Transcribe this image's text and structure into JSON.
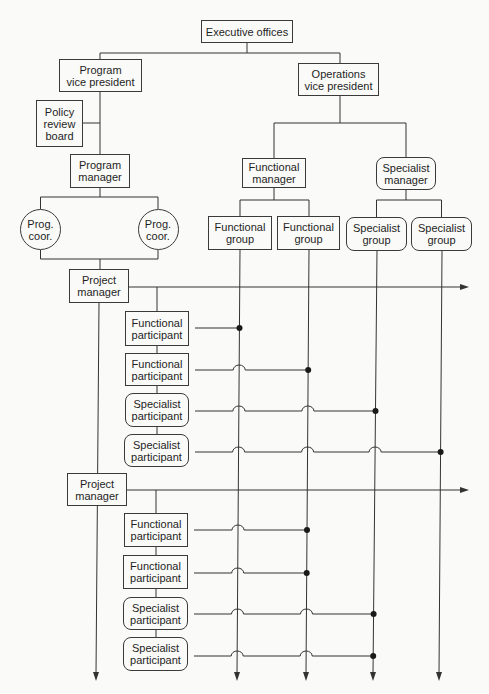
{
  "diagram": {
    "executive_offices": {
      "lines": [
        "Executive offices"
      ]
    },
    "program_vice_president": {
      "lines": [
        "Program",
        "vice president"
      ]
    },
    "operations_vice_president": {
      "lines": [
        "Operations",
        "vice president"
      ]
    },
    "policy_review_board": {
      "lines": [
        "Policy",
        "review",
        "board"
      ]
    },
    "program_manager": {
      "lines": [
        "Program",
        "manager"
      ]
    },
    "program_coordinators": [
      {
        "lines": [
          "Prog.",
          "coor."
        ]
      },
      {
        "lines": [
          "Prog.",
          "coor."
        ]
      }
    ],
    "functional_manager": {
      "lines": [
        "Functional",
        "manager"
      ]
    },
    "specialist_manager": {
      "lines": [
        "Specialist",
        "manager"
      ]
    },
    "functional_groups": [
      {
        "lines": [
          "Functional",
          "group"
        ]
      },
      {
        "lines": [
          "Functional",
          "group"
        ]
      }
    ],
    "specialist_groups": [
      {
        "lines": [
          "Specialist",
          "group"
        ]
      },
      {
        "lines": [
          "Specialist",
          "group"
        ]
      }
    ],
    "projects": [
      {
        "manager": {
          "lines": [
            "Project",
            "manager"
          ]
        },
        "participants": [
          {
            "lines": [
              "Functional",
              "participant"
            ],
            "connects_to": "functional_group_1"
          },
          {
            "lines": [
              "Functional",
              "participant"
            ],
            "connects_to": "functional_group_2"
          },
          {
            "lines": [
              "Specialist",
              "participant"
            ],
            "connects_to": "specialist_group_1"
          },
          {
            "lines": [
              "Specialist",
              "participant"
            ],
            "connects_to": "specialist_group_2"
          }
        ]
      },
      {
        "manager": {
          "lines": [
            "Project",
            "manager"
          ]
        },
        "participants": [
          {
            "lines": [
              "Functional",
              "participant"
            ],
            "connects_to": "functional_group_2"
          },
          {
            "lines": [
              "Functional",
              "participant"
            ],
            "connects_to": "functional_group_2"
          },
          {
            "lines": [
              "Specialist",
              "participant"
            ],
            "connects_to": "specialist_group_1"
          },
          {
            "lines": [
              "Specialist",
              "participant"
            ],
            "connects_to": "specialist_group_1"
          }
        ]
      }
    ]
  },
  "colors": {
    "background": "#fafaf8",
    "line": "#333333",
    "box_border": "#3a3a3a",
    "text": "#1e1e1e",
    "junction_dot": "#1a1a1a"
  }
}
